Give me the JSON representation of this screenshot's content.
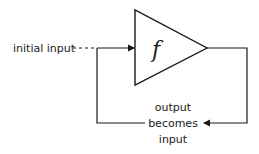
{
  "diagram": {
    "type": "feedback-loop",
    "function_label": "f",
    "input_label": "initial input",
    "feedback_label_lines": [
      "output",
      "becomes",
      "input"
    ],
    "stroke_color": "#1a1a1a",
    "background_color": "#ffffff"
  }
}
